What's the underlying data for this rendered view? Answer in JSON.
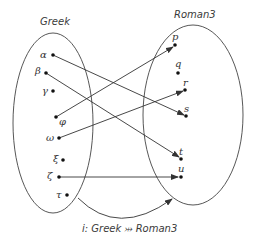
{
  "diagram": {
    "type": "set-mapping",
    "sets": [
      {
        "name": "Greek",
        "elements": [
          {
            "label": "α",
            "x": 53,
            "y": 55
          },
          {
            "label": "β",
            "x": 46,
            "y": 73
          },
          {
            "label": "γ",
            "x": 53,
            "y": 91
          },
          {
            "label": "φ",
            "x": 56,
            "y": 117
          },
          {
            "label": "ω",
            "x": 59,
            "y": 138
          },
          {
            "label": "ξ",
            "x": 63,
            "y": 160
          },
          {
            "label": "ζ",
            "x": 59,
            "y": 177
          },
          {
            "label": "τ",
            "x": 67,
            "y": 195
          }
        ]
      },
      {
        "name": "Roman3",
        "elements": [
          {
            "label": "p",
            "x": 175,
            "y": 45
          },
          {
            "label": "q",
            "x": 178,
            "y": 73
          },
          {
            "label": "r",
            "x": 185,
            "y": 90
          },
          {
            "label": "s",
            "x": 186,
            "y": 116
          },
          {
            "label": "t",
            "x": 181,
            "y": 159
          },
          {
            "label": "u",
            "x": 181,
            "y": 177
          }
        ]
      }
    ],
    "mappings": [
      {
        "from": "α",
        "to": "s"
      },
      {
        "from": "β",
        "to": "t"
      },
      {
        "from": "φ",
        "to": "p"
      },
      {
        "from": "ω",
        "to": "r"
      },
      {
        "from": "ζ",
        "to": "u"
      }
    ],
    "function_label": "i: Greek ⤔ Roman3",
    "colors": {
      "stroke": "#333333",
      "dot": "#111111",
      "text": "#3a3a3a"
    }
  }
}
